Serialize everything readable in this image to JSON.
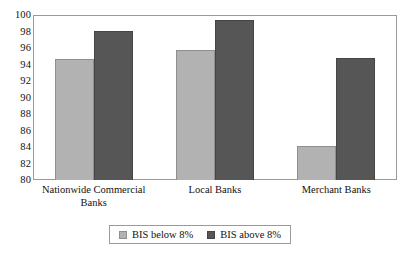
{
  "chart_data": {
    "type": "bar",
    "title": "",
    "subtitle": "",
    "xlabel": "",
    "ylabel": "",
    "categories": [
      "Nationwide Commercial Banks",
      "Local Banks",
      "Merchant Banks"
    ],
    "category_lines": [
      [
        "Nationwide Commercial",
        "Banks"
      ],
      [
        "Local Banks"
      ],
      [
        "Merchant Banks"
      ]
    ],
    "series": [
      {
        "name": "BIS below 8%",
        "color": "#b2b2b2",
        "values": [
          94.7,
          95.8,
          84.1
        ]
      },
      {
        "name": "BIS above 8%",
        "color": "#565656",
        "values": [
          98.1,
          99.4,
          94.8
        ]
      }
    ],
    "ylim": [
      80,
      100
    ],
    "ytick_step": 2,
    "yticks": [
      100,
      98,
      96,
      94,
      92,
      90,
      88,
      86,
      84,
      82,
      80
    ],
    "ytick_labels": [
      "100",
      "98",
      "96",
      "94",
      "92",
      "90",
      "88",
      "86",
      "84",
      "82",
      "80"
    ],
    "grid": false,
    "legend_position": "bottom-center",
    "legend_entries": [
      "BIS below 8%",
      "BIS above 8%"
    ]
  },
  "colors": {
    "series_light": "#b2b2b2",
    "series_dark": "#565656",
    "frame": "#9a9a9a",
    "text": "#111111",
    "background": "#ffffff"
  }
}
